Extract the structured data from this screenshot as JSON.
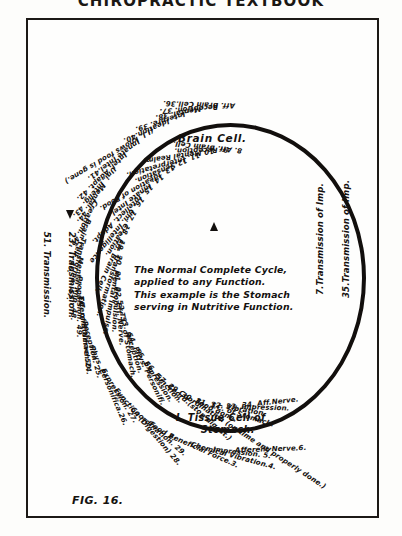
{
  "page": {
    "running_head": "CHIROPRACTIC TEXTBOOK",
    "figure_label": "FIG. 16."
  },
  "center_caption": {
    "line1": "The Normal Complete   Cycle,",
    "line2": "applied to any Function.",
    "line3": "This example is the Stomach",
    "line4": "serving in Nutritive Function."
  },
  "nodes": {
    "brain_cell": "Brain Cell.",
    "tissue_cell_line1": "I. Tissue Cell of",
    "tissue_cell_line2": "Stomach."
  },
  "transmission": {
    "right_outer": "35.Transmission of Imp.",
    "right_inner": "7.Transmission of Imp.",
    "left_outer": "51. Transmission.",
    "left_inner": "23. Transmission."
  },
  "outer_labels": [
    "Aff. Brain Cell.36.",
    "Reception. 37.",
    "Mental. 38.",
    "Interpre. 39.",
    "Ideation.40.",
    "(I.I. knows food is gone.)",
    "Innate Intel.41.",
    "Intel. Adapt. 42.",
    "Uni. Intelig. 43.",
    "Mental. 44.",
    "Creation. 45.",
    "Brain Cell. 46.",
    "Transforma. 47.",
    "Mental Imp. 48.",
    "Propulsion. 49.",
    "Efferent Nerve  50.",
    "T.C. of Stomach.24.",
    "Reception. 25.",
    "Phys. Personifica.26.",
    "Expression. 27.",
    "Function (Digestion) 28.",
    "Coordination. 29.",
    "Food 2.",
    "Beneficial Force.3.",
    "Chemical Vibration.4.",
    "Impression.   5.",
    "Afferent Nerve.6."
  ],
  "inner_labels": [
    "8. Aff. Brain Cell.",
    "9. Reception.",
    "10.Mental Realm.",
    "11. Interpretation.",
    "12.Sensation.",
    "13. Ideation of Food.",
    "14. Innate Intel.",
    "15. Intellect. Adapt.",
    "16. Uni. Intelligence",
    "17. Creation.",
    "18. Eff. Brain Cell.",
    "19. Transformation.",
    "20. Mental Impulse.",
    "21. Propulsion.",
    "22. Eff. Nerve.",
    "52.T.C. of Stomach.",
    "53. Reception.",
    "54. Phys. Personifi.",
    "55. Expression.",
    "56. Function.",
    "57. Coord.(stop digest.)",
    "29.Coordination (on time and properly done.)",
    "30. Food gone.",
    "31. T.C. of Stomach.",
    "32. Vibration.",
    "33. Impression.",
    "34. Aff.Nerve."
  ]
}
